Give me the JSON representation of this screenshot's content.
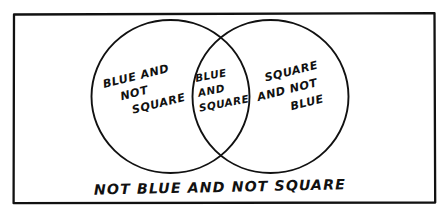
{
  "diagram": {
    "type": "venn-2set",
    "style": "hand-drawn black ink on white",
    "colors": {
      "ink": "#111111",
      "background": "#ffffff"
    },
    "universe": {
      "name": "universe-rectangle",
      "shape": "rectangle"
    },
    "sets": [
      {
        "name": "blue-set",
        "label": "BLUE",
        "shape": "circle",
        "position": "left"
      },
      {
        "name": "square-set",
        "label": "SQUARE",
        "shape": "circle",
        "position": "right"
      }
    ],
    "regions": {
      "left_only": {
        "name": "blue-and-not-square",
        "lines": [
          "BLUE AND",
          "NOT",
          "SQUARE"
        ],
        "text": "BLUE AND NOT SQUARE"
      },
      "intersection": {
        "name": "blue-and-square",
        "lines": [
          "BLUE",
          "AND",
          "SQUARE"
        ],
        "text": "BLUE AND SQUARE"
      },
      "right_only": {
        "name": "square-and-not-blue",
        "lines": [
          "SQUARE",
          "AND NOT",
          "BLUE"
        ],
        "text": "SQUARE AND NOT BLUE"
      },
      "outside": {
        "name": "not-blue-and-not-square",
        "lines": [
          "NOT BLUE AND NOT SQUARE"
        ],
        "text": "NOT BLUE AND NOT SQUARE"
      }
    }
  }
}
